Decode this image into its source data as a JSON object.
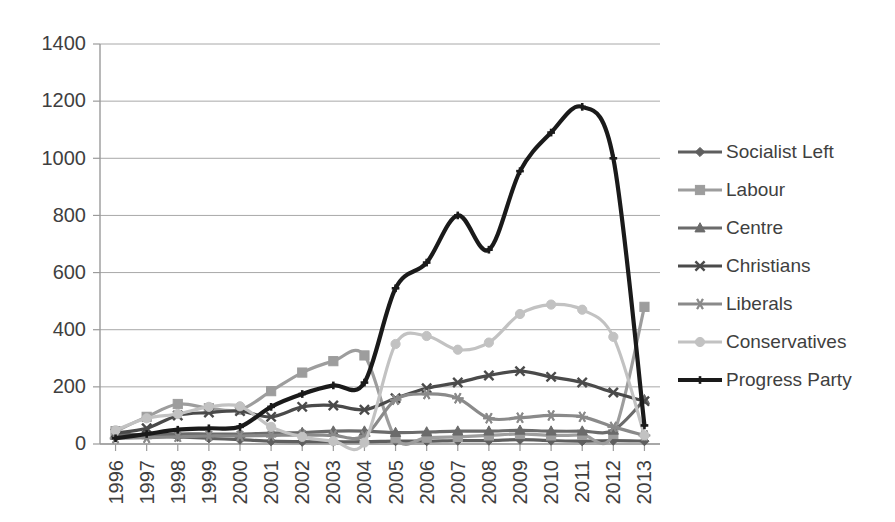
{
  "chart_data": {
    "type": "line",
    "title": "",
    "subtitle": "",
    "xlabel": "",
    "ylabel": "",
    "categories": [
      "1996",
      "1997",
      "1998",
      "1999",
      "2000",
      "2001",
      "2002",
      "2003",
      "2004",
      "2005",
      "2006",
      "2007",
      "2008",
      "2009",
      "2010",
      "2011",
      "2012",
      "2013"
    ],
    "x_tick_rotation": "-90",
    "ylim": [
      0,
      1400
    ],
    "y_ticks": [
      0,
      200,
      400,
      600,
      800,
      1000,
      1200,
      1400
    ],
    "y_tick_labels": [
      "0",
      "200",
      "400",
      "600",
      "800",
      "1000",
      "1200",
      "1400"
    ],
    "grid": "horizontal",
    "legend_position": "right",
    "series": [
      {
        "name": "Socialist Left",
        "marker": "diamond",
        "color": "#5e5e5e",
        "values": [
          35,
          30,
          25,
          20,
          15,
          10,
          8,
          8,
          8,
          10,
          10,
          12,
          12,
          15,
          12,
          10,
          12,
          10
        ]
      },
      {
        "name": "Labour",
        "marker": "square",
        "color": "#9d9d9d",
        "values": [
          45,
          95,
          140,
          125,
          120,
          185,
          250,
          290,
          310,
          20,
          22,
          25,
          30,
          35,
          30,
          32,
          35,
          480
        ]
      },
      {
        "name": "Centre",
        "marker": "triangle",
        "color": "#6b6b6b",
        "values": [
          30,
          32,
          35,
          35,
          35,
          38,
          40,
          45,
          45,
          40,
          42,
          45,
          45,
          48,
          45,
          45,
          48,
          155
        ]
      },
      {
        "name": "Christians",
        "marker": "x",
        "color": "#4a4a4a",
        "values": [
          38,
          55,
          100,
          110,
          115,
          95,
          130,
          135,
          120,
          160,
          195,
          215,
          240,
          255,
          235,
          215,
          180,
          150
        ]
      },
      {
        "name": "Liberals",
        "marker": "asterisk",
        "color": "#8a8a8a",
        "values": [
          20,
          22,
          25,
          28,
          28,
          30,
          32,
          30,
          28,
          155,
          175,
          160,
          90,
          92,
          100,
          95,
          60,
          30
        ]
      },
      {
        "name": "Conservatives",
        "marker": "circle",
        "color": "#c2c2c2",
        "values": [
          48,
          90,
          105,
          130,
          132,
          60,
          25,
          10,
          5,
          350,
          378,
          330,
          355,
          455,
          488,
          470,
          375,
          30
        ]
      },
      {
        "name": "Progress Party",
        "marker": "plus",
        "color": "#1a1a1a",
        "values": [
          20,
          35,
          50,
          55,
          60,
          130,
          175,
          205,
          215,
          545,
          635,
          800,
          680,
          955,
          1090,
          1180,
          1000,
          65
        ]
      }
    ]
  },
  "legend": {
    "entries": [
      {
        "label": "Socialist Left"
      },
      {
        "label": "Labour"
      },
      {
        "label": "Centre"
      },
      {
        "label": "Christians"
      },
      {
        "label": "Liberals"
      },
      {
        "label": "Conservatives"
      },
      {
        "label": "Progress Party"
      }
    ]
  }
}
